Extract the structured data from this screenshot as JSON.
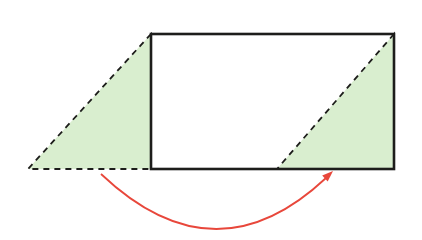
{
  "canvas": {
    "width": "422",
    "height": "240",
    "viewbox": "0 0 422 240",
    "background": "#ffffff"
  },
  "colors": {
    "line_black": "#1d1d1b",
    "triangle_green": "#d9eecf",
    "arrow_red": "#e8473b"
  },
  "rectangle": {
    "x": "151",
    "y": "34",
    "width": "243",
    "height": "135",
    "stroke_width": "2.6",
    "fill": "none"
  },
  "left_triangle": {
    "points": "151,34 28,169 151,169"
  },
  "right_triangle": {
    "points": "394,34 277,169 394,169"
  },
  "dash": {
    "array": "6 5",
    "stroke_width": "1.8"
  },
  "arrow": {
    "arc_path": "M 101 174 Q 215 282 326 178",
    "head_points": "333,171 327.7,181.4 322.2,175.6",
    "stroke_width": "1.8"
  }
}
